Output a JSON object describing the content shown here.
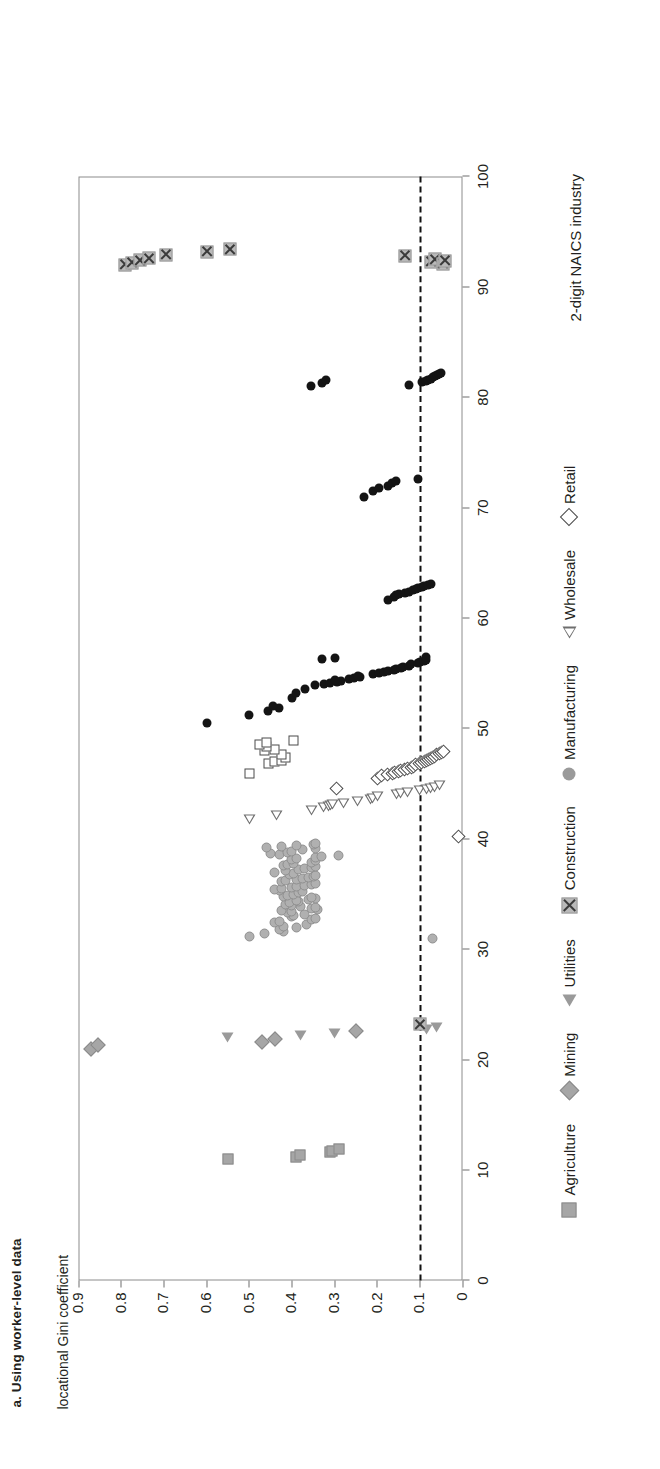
{
  "figure": {
    "title": "a. Using worker-level data",
    "ylabel": "locational Gini coefficient",
    "xlabel": "2-digit NAICS industry"
  },
  "axes": {
    "yticks": [
      "0",
      "0.1",
      "0.2",
      "0.3",
      "0.4",
      "0.5",
      "0.6",
      "0.7",
      "0.8",
      "0.9"
    ],
    "xticks": [
      "0",
      "10",
      "20",
      "30",
      "40",
      "50",
      "60",
      "70",
      "80",
      "90",
      "100"
    ]
  },
  "legend": [
    {
      "label": "Agriculture",
      "marker": "filled-square-icon"
    },
    {
      "label": "Mining",
      "marker": "filled-diamond-icon"
    },
    {
      "label": "Utilities",
      "marker": "filled-triangle-icon"
    },
    {
      "label": "Construction",
      "marker": "x-box-icon"
    },
    {
      "label": "Manufacturing",
      "marker": "filled-circle-icon"
    },
    {
      "label": "Wholesale",
      "marker": "open-triangle-icon"
    },
    {
      "label": "Retail",
      "marker": "open-diamond-icon"
    }
  ],
  "annotations": {
    "reference_line_value": 0.1,
    "reference_line_style": "dashed"
  },
  "chart_data": {
    "type": "scatter",
    "title": "a. Using worker-level data",
    "xlabel": "2-digit NAICS industry",
    "ylabel": "locational Gini coefficient",
    "xlim": [
      0,
      100
    ],
    "ylim": [
      0,
      0.9
    ],
    "grid": false,
    "legend_position": "bottom",
    "reference_lines": [
      {
        "axis": "y",
        "value": 0.1,
        "style": "dashed",
        "color": "#111111"
      }
    ],
    "series": [
      {
        "name": "Agriculture",
        "marker": "filled-square",
        "color": "#a6a6a6",
        "points": [
          [
            11.0,
            0.55
          ],
          [
            11.2,
            0.39
          ],
          [
            11.4,
            0.38
          ],
          [
            11.6,
            0.31
          ],
          [
            11.7,
            0.305
          ],
          [
            11.9,
            0.29
          ]
        ]
      },
      {
        "name": "Mining",
        "marker": "filled-diamond",
        "color": "#a6a6a6",
        "points": [
          [
            21.0,
            0.87
          ],
          [
            21.3,
            0.855
          ],
          [
            21.6,
            0.47
          ],
          [
            21.9,
            0.44
          ],
          [
            22.6,
            0.25
          ]
        ]
      },
      {
        "name": "Utilities",
        "marker": "filled-triangle",
        "color": "#9a9a9a",
        "points": [
          [
            22.0,
            0.55
          ],
          [
            22.2,
            0.38
          ],
          [
            22.4,
            0.3
          ],
          [
            22.7,
            0.085
          ],
          [
            22.9,
            0.06
          ]
        ]
      },
      {
        "name": "Construction",
        "marker": "x-box",
        "color": "#b9b9b9",
        "points": [
          [
            23.2,
            0.1
          ]
        ]
      },
      {
        "name": "Manufacturing",
        "marker": "filled-circle-gray",
        "color": "#b0b0b0",
        "points": [
          [
            31.0,
            0.07
          ],
          [
            31.2,
            0.5
          ],
          [
            31.4,
            0.465
          ],
          [
            31.6,
            0.42
          ],
          [
            31.8,
            0.43
          ],
          [
            32.0,
            0.39
          ],
          [
            32.1,
            0.42
          ],
          [
            32.25,
            0.365
          ],
          [
            32.4,
            0.44
          ],
          [
            32.55,
            0.43
          ],
          [
            32.7,
            0.355
          ],
          [
            32.8,
            0.345
          ],
          [
            32.95,
            0.4
          ],
          [
            33.05,
            0.395
          ],
          [
            33.15,
            0.37
          ],
          [
            33.3,
            0.41
          ],
          [
            33.4,
            0.4
          ],
          [
            33.5,
            0.425
          ],
          [
            33.6,
            0.34
          ],
          [
            33.7,
            0.355
          ],
          [
            33.8,
            0.345
          ],
          [
            33.9,
            0.38
          ],
          [
            34.0,
            0.4
          ],
          [
            34.1,
            0.415
          ],
          [
            34.2,
            0.405
          ],
          [
            34.3,
            0.385
          ],
          [
            34.4,
            0.39
          ],
          [
            34.5,
            0.36
          ],
          [
            34.6,
            0.345
          ],
          [
            34.7,
            0.355
          ],
          [
            34.8,
            0.42
          ],
          [
            34.9,
            0.41
          ],
          [
            35.0,
            0.395
          ],
          [
            35.1,
            0.385
          ],
          [
            35.2,
            0.375
          ],
          [
            35.3,
            0.43
          ],
          [
            35.4,
            0.44
          ],
          [
            35.5,
            0.425
          ],
          [
            35.6,
            0.4
          ],
          [
            35.7,
            0.39
          ],
          [
            35.8,
            0.37
          ],
          [
            35.9,
            0.355
          ],
          [
            36.0,
            0.345
          ],
          [
            36.1,
            0.425
          ],
          [
            36.2,
            0.415
          ],
          [
            36.3,
            0.39
          ],
          [
            36.4,
            0.375
          ],
          [
            36.5,
            0.36
          ],
          [
            36.6,
            0.35
          ],
          [
            36.7,
            0.345
          ],
          [
            36.8,
            0.405
          ],
          [
            36.9,
            0.395
          ],
          [
            37.0,
            0.44
          ],
          [
            37.1,
            0.415
          ],
          [
            37.2,
            0.385
          ],
          [
            37.3,
            0.37
          ],
          [
            37.4,
            0.355
          ],
          [
            37.5,
            0.345
          ],
          [
            37.6,
            0.42
          ],
          [
            37.7,
            0.41
          ],
          [
            37.8,
            0.395
          ],
          [
            37.9,
            0.355
          ],
          [
            38.0,
            0.345
          ],
          [
            38.1,
            0.4
          ],
          [
            38.2,
            0.39
          ],
          [
            38.3,
            0.345
          ],
          [
            38.4,
            0.33
          ],
          [
            38.5,
            0.29
          ],
          [
            38.6,
            0.43
          ],
          [
            38.7,
            0.45
          ],
          [
            38.8,
            0.41
          ],
          [
            38.9,
            0.4
          ],
          [
            39.0,
            0.375
          ],
          [
            39.1,
            0.345
          ],
          [
            39.2,
            0.46
          ],
          [
            39.3,
            0.425
          ],
          [
            39.4,
            0.39
          ],
          [
            39.5,
            0.35
          ],
          [
            39.6,
            0.345
          ]
        ]
      },
      {
        "name": "Wholesale",
        "marker": "open-triangle",
        "color": "#8d8d8d",
        "points": [
          [
            41.8,
            0.5
          ],
          [
            42.1,
            0.435
          ],
          [
            42.6,
            0.355
          ],
          [
            42.8,
            0.325
          ],
          [
            42.9,
            0.315
          ],
          [
            43.0,
            0.31
          ],
          [
            43.1,
            0.305
          ],
          [
            43.2,
            0.28
          ],
          [
            43.4,
            0.245
          ],
          [
            43.6,
            0.215
          ],
          [
            43.7,
            0.21
          ],
          [
            43.85,
            0.2
          ],
          [
            44.0,
            0.155
          ],
          [
            44.1,
            0.145
          ],
          [
            44.2,
            0.13
          ],
          [
            44.35,
            0.1
          ],
          [
            44.5,
            0.085
          ],
          [
            44.6,
            0.075
          ],
          [
            44.7,
            0.065
          ],
          [
            44.8,
            0.055
          ]
        ]
      },
      {
        "name": "Retail",
        "marker": "open-diamond",
        "color": "#4a4a4a",
        "points": [
          [
            40.2,
            0.01
          ],
          [
            44.6,
            0.295
          ],
          [
            45.5,
            0.2
          ],
          [
            45.7,
            0.19
          ],
          [
            45.8,
            0.175
          ],
          [
            45.9,
            0.165
          ],
          [
            46.0,
            0.16
          ],
          [
            46.1,
            0.15
          ],
          [
            46.2,
            0.145
          ],
          [
            46.3,
            0.135
          ],
          [
            46.4,
            0.13
          ],
          [
            46.5,
            0.12
          ],
          [
            46.6,
            0.115
          ],
          [
            46.7,
            0.11
          ],
          [
            46.8,
            0.1
          ],
          [
            46.9,
            0.095
          ],
          [
            47.0,
            0.09
          ],
          [
            47.1,
            0.085
          ],
          [
            47.2,
            0.08
          ],
          [
            47.3,
            0.075
          ],
          [
            47.4,
            0.07
          ],
          [
            47.5,
            0.065
          ],
          [
            47.6,
            0.06
          ],
          [
            47.7,
            0.055
          ],
          [
            47.8,
            0.05
          ],
          [
            47.9,
            0.045
          ]
        ]
      },
      {
        "name": "Transport-Info (open square)",
        "marker": "open-square",
        "color": "#4a4a4a",
        "points": [
          [
            45.9,
            0.5
          ],
          [
            46.8,
            0.455
          ],
          [
            47.0,
            0.44
          ],
          [
            47.1,
            0.425
          ],
          [
            47.4,
            0.415
          ],
          [
            47.6,
            0.425
          ],
          [
            48.0,
            0.465
          ],
          [
            48.1,
            0.44
          ],
          [
            48.4,
            0.46
          ],
          [
            48.55,
            0.475
          ],
          [
            48.75,
            0.46
          ],
          [
            48.9,
            0.395
          ]
        ]
      },
      {
        "name": "Manufacturing (black)",
        "marker": "filled-circle-black",
        "color": "#141414",
        "points": [
          [
            50.5,
            0.6
          ],
          [
            51.2,
            0.5
          ],
          [
            51.6,
            0.455
          ],
          [
            51.9,
            0.43
          ],
          [
            52.0,
            0.445
          ],
          [
            52.8,
            0.4
          ],
          [
            53.2,
            0.39
          ],
          [
            53.6,
            0.37
          ],
          [
            53.9,
            0.345
          ],
          [
            54.0,
            0.325
          ],
          [
            54.1,
            0.31
          ],
          [
            54.2,
            0.295
          ],
          [
            54.3,
            0.285
          ],
          [
            54.4,
            0.3
          ],
          [
            54.5,
            0.265
          ],
          [
            54.6,
            0.255
          ],
          [
            54.7,
            0.24
          ],
          [
            54.8,
            0.245
          ],
          [
            54.9,
            0.21
          ],
          [
            55.0,
            0.195
          ],
          [
            55.1,
            0.185
          ],
          [
            55.2,
            0.175
          ],
          [
            55.3,
            0.16
          ],
          [
            55.4,
            0.155
          ],
          [
            55.5,
            0.145
          ],
          [
            55.6,
            0.14
          ],
          [
            55.7,
            0.125
          ],
          [
            55.8,
            0.12
          ],
          [
            55.9,
            0.105
          ],
          [
            56.0,
            0.1
          ],
          [
            56.1,
            0.09
          ],
          [
            56.2,
            0.085
          ],
          [
            56.3,
            0.33
          ],
          [
            56.4,
            0.3
          ],
          [
            56.5,
            0.085
          ],
          [
            61.6,
            0.175
          ],
          [
            61.9,
            0.16
          ],
          [
            62.1,
            0.155
          ],
          [
            62.2,
            0.15
          ],
          [
            62.3,
            0.135
          ],
          [
            62.4,
            0.125
          ],
          [
            62.5,
            0.115
          ],
          [
            62.6,
            0.11
          ],
          [
            62.7,
            0.105
          ],
          [
            62.8,
            0.095
          ],
          [
            62.9,
            0.09
          ],
          [
            63.0,
            0.08
          ],
          [
            63.1,
            0.075
          ],
          [
            71.0,
            0.23
          ],
          [
            71.5,
            0.21
          ],
          [
            71.8,
            0.195
          ],
          [
            72.0,
            0.175
          ],
          [
            72.2,
            0.165
          ],
          [
            72.4,
            0.155
          ],
          [
            72.6,
            0.105
          ],
          [
            81.0,
            0.355
          ],
          [
            81.3,
            0.33
          ],
          [
            81.6,
            0.32
          ],
          [
            81.1,
            0.125
          ],
          [
            81.4,
            0.095
          ],
          [
            81.5,
            0.085
          ],
          [
            81.6,
            0.08
          ],
          [
            81.7,
            0.075
          ],
          [
            81.8,
            0.07
          ],
          [
            81.9,
            0.065
          ],
          [
            82.0,
            0.06
          ],
          [
            82.1,
            0.055
          ],
          [
            82.2,
            0.05
          ]
        ]
      },
      {
        "name": "Construction (X markers, high)",
        "marker": "x-box",
        "color": "#b9b9b9",
        "points": [
          [
            92.0,
            0.79
          ],
          [
            92.2,
            0.775
          ],
          [
            92.4,
            0.755
          ],
          [
            92.6,
            0.735
          ],
          [
            92.9,
            0.695
          ],
          [
            93.2,
            0.6
          ],
          [
            93.4,
            0.545
          ],
          [
            92.8,
            0.135
          ],
          [
            92.3,
            0.075
          ],
          [
            92.5,
            0.065
          ],
          [
            92.1,
            0.045
          ],
          [
            92.35,
            0.04
          ]
        ]
      }
    ]
  }
}
